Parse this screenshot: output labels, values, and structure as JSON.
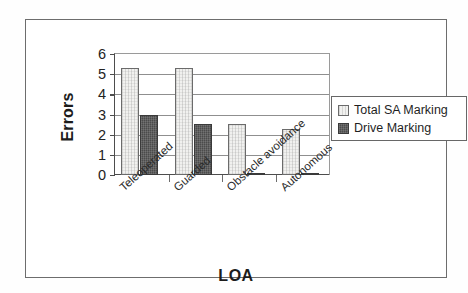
{
  "chart_data": {
    "type": "bar",
    "title": "",
    "subtitle": "",
    "xlabel": "LOA",
    "ylabel": "Errors",
    "categories": [
      "Teleoperated",
      "Guarded",
      "Obstacle avoidance",
      "Autonomous"
    ],
    "series": [
      {
        "name": "Total SA Marking",
        "values": [
          5.3,
          5.3,
          2.55,
          2.27
        ],
        "color": "#f1f1ef"
      },
      {
        "name": "Drive Marking",
        "values": [
          3.0,
          2.55,
          0.1,
          0.1
        ],
        "color": "#4b4b4b"
      }
    ],
    "ylim": [
      0,
      6
    ],
    "yticks": [
      0,
      1,
      2,
      3,
      4,
      5,
      6
    ],
    "ytick_labels": [
      "0",
      "1",
      "2",
      "3",
      "4",
      "5",
      "6"
    ],
    "grid": true,
    "grid_axis": "y",
    "legend_position": "right",
    "legend_entries": [
      "Total SA Marking",
      "Drive Marking"
    ]
  },
  "colors": {
    "frame": "#6d6d6d",
    "axis": "#4d4d4d",
    "gridline": "#8f8f8f",
    "text": "#1c1c1c",
    "series_light": "#f1f1ef",
    "series_dark": "#4b4b4b"
  }
}
